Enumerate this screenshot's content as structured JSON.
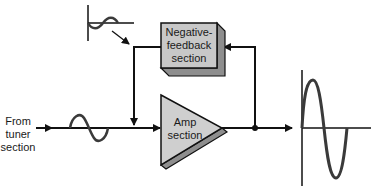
{
  "diagram": {
    "input_label": [
      "From",
      "tuner",
      "section"
    ],
    "feedback_block": {
      "label": [
        "Negative-",
        "feedback",
        "section"
      ],
      "fill": "#c8c8c8",
      "shade": "#8e8e8e"
    },
    "amp_block": {
      "label": [
        "Amp",
        "section"
      ],
      "fill": "#cfcfcf",
      "shade": "#8e8e8e"
    },
    "colors": {
      "line": "#111111",
      "waveform": "#3a3a3a"
    },
    "nodes": [
      {
        "id": "input",
        "label": "From tuner section"
      },
      {
        "id": "feedback",
        "label": "Negative-feedback section"
      },
      {
        "id": "amp",
        "label": "Amp section"
      },
      {
        "id": "output",
        "label": "output waveform (large sine)"
      },
      {
        "id": "feedback_signal",
        "label": "inverted feedback waveform (small sine)"
      }
    ],
    "edges": [
      {
        "from": "input",
        "to": "amp",
        "note": "small sine on input line"
      },
      {
        "from": "amp",
        "to": "output"
      },
      {
        "from": "amp",
        "to": "feedback",
        "note": "tap from output junction"
      },
      {
        "from": "feedback",
        "to": "amp",
        "note": "feedback injected into input line"
      }
    ]
  }
}
